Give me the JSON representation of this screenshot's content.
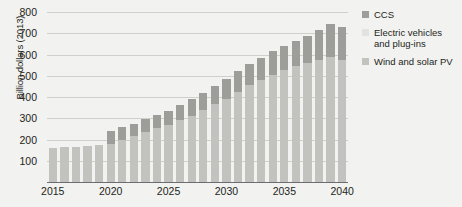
{
  "chart_data": {
    "type": "bar",
    "stacked": true,
    "title": "",
    "xlabel": "",
    "ylabel": "Billion dollars (2013)",
    "ylim": [
      0,
      800
    ],
    "yticks": [
      100,
      200,
      300,
      400,
      500,
      600,
      700,
      800
    ],
    "grid": true,
    "legend_position": "right",
    "x": [
      2015,
      2016,
      2017,
      2018,
      2019,
      2020,
      2021,
      2022,
      2023,
      2024,
      2025,
      2026,
      2027,
      2028,
      2029,
      2030,
      2031,
      2032,
      2033,
      2034,
      2035,
      2036,
      2037,
      2038,
      2039,
      2040
    ],
    "xticks": [
      "2015",
      "2020",
      "2025",
      "2030",
      "2035",
      "2040"
    ],
    "series": [
      {
        "name": "Wind and solar PV",
        "color": "#c2c2bf",
        "values": [
          160,
          163,
          165,
          168,
          172,
          178,
          196,
          215,
          235,
          252,
          268,
          290,
          312,
          338,
          365,
          392,
          425,
          455,
          480,
          505,
          528,
          545,
          560,
          575,
          590,
          575
        ]
      },
      {
        "name": "Electric vehicles and plug-ins",
        "color": "#e2e2df",
        "values": [
          0,
          0,
          0,
          0,
          0,
          0,
          0,
          0,
          0,
          0,
          0,
          0,
          0,
          0,
          0,
          0,
          0,
          0,
          0,
          0,
          0,
          0,
          0,
          0,
          0,
          0
        ]
      },
      {
        "name": "CCS",
        "color": "#9d9d9a",
        "values": [
          0,
          0,
          0,
          0,
          0,
          60,
          62,
          60,
          62,
          65,
          68,
          72,
          78,
          82,
          88,
          92,
          96,
          100,
          105,
          110,
          112,
          118,
          128,
          140,
          155,
          155
        ]
      }
    ],
    "totals": [
      160,
      163,
      165,
      168,
      172,
      238,
      258,
      275,
      297,
      317,
      336,
      362,
      390,
      420,
      453,
      484,
      521,
      555,
      585,
      615,
      640,
      663,
      688,
      715,
      745,
      730
    ]
  },
  "legend": {
    "items": [
      {
        "label": "CCS",
        "color": "#9d9d9a"
      },
      {
        "label": "Electric vehicles and plug-ins",
        "color": "#e2e2df"
      },
      {
        "label": "Wind and solar PV",
        "color": "#c2c2bf"
      }
    ]
  }
}
